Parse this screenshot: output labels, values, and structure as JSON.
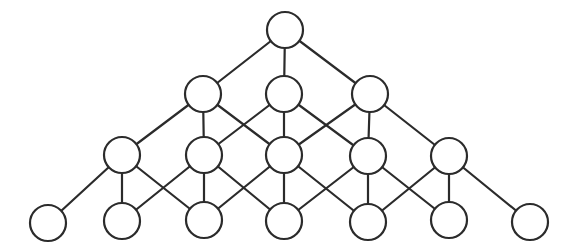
{
  "diagram": {
    "type": "lattice-graph",
    "node_style": {
      "radius": 18,
      "fill": "#ffffff",
      "stroke": "#2b2b2b"
    },
    "edge_style": {
      "stroke": "#2b2b2b"
    },
    "levels": [
      {
        "name": "level-1",
        "nodes": [
          {
            "id": "n1",
            "x": 285,
            "y": 30
          }
        ]
      },
      {
        "name": "level-2",
        "nodes": [
          {
            "id": "n2a",
            "x": 203,
            "y": 94
          },
          {
            "id": "n2b",
            "x": 284,
            "y": 94
          },
          {
            "id": "n2c",
            "x": 370,
            "y": 94
          }
        ]
      },
      {
        "name": "level-3",
        "nodes": [
          {
            "id": "n3a",
            "x": 122,
            "y": 155
          },
          {
            "id": "n3b",
            "x": 204,
            "y": 155
          },
          {
            "id": "n3c",
            "x": 284,
            "y": 155
          },
          {
            "id": "n3d",
            "x": 368,
            "y": 156
          },
          {
            "id": "n3e",
            "x": 449,
            "y": 156
          }
        ]
      },
      {
        "name": "level-4",
        "nodes": [
          {
            "id": "n4a",
            "x": 48,
            "y": 223
          },
          {
            "id": "n4b",
            "x": 122,
            "y": 221
          },
          {
            "id": "n4c",
            "x": 204,
            "y": 220
          },
          {
            "id": "n4d",
            "x": 284,
            "y": 221
          },
          {
            "id": "n4e",
            "x": 368,
            "y": 222
          },
          {
            "id": "n4f",
            "x": 449,
            "y": 220
          },
          {
            "id": "n4g",
            "x": 530,
            "y": 222
          }
        ]
      }
    ],
    "edges": [
      [
        "n1",
        "n2a"
      ],
      [
        "n1",
        "n2b"
      ],
      [
        "n1",
        "n2c"
      ],
      [
        "n2a",
        "n3a"
      ],
      [
        "n2a",
        "n3b"
      ],
      [
        "n2a",
        "n3c"
      ],
      [
        "n2b",
        "n3b"
      ],
      [
        "n2b",
        "n3c"
      ],
      [
        "n2b",
        "n3d"
      ],
      [
        "n2c",
        "n3c"
      ],
      [
        "n2c",
        "n3d"
      ],
      [
        "n2c",
        "n3e"
      ],
      [
        "n3a",
        "n4a"
      ],
      [
        "n3a",
        "n4b"
      ],
      [
        "n3a",
        "n4c"
      ],
      [
        "n3b",
        "n4b"
      ],
      [
        "n3b",
        "n4c"
      ],
      [
        "n3b",
        "n4d"
      ],
      [
        "n3c",
        "n4c"
      ],
      [
        "n3c",
        "n4d"
      ],
      [
        "n3c",
        "n4e"
      ],
      [
        "n3d",
        "n4d"
      ],
      [
        "n3d",
        "n4e"
      ],
      [
        "n3d",
        "n4f"
      ],
      [
        "n3e",
        "n4e"
      ],
      [
        "n3e",
        "n4f"
      ],
      [
        "n3e",
        "n4g"
      ]
    ]
  }
}
